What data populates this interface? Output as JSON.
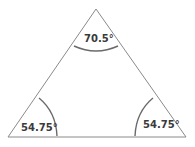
{
  "diagram": {
    "shape": "triangle",
    "angles": [
      {
        "vertex": "top",
        "label": "70.5°",
        "value_deg": 70.5
      },
      {
        "vertex": "bottom-left",
        "label": "54.75°",
        "value_deg": 54.75
      },
      {
        "vertex": "bottom-right",
        "label": "54.75°",
        "value_deg": 54.75
      }
    ],
    "colors": {
      "edge": "#8a8a8a",
      "arc": "#6a6a6a",
      "label": "#3a3a3a",
      "background": "#ffffff"
    }
  }
}
